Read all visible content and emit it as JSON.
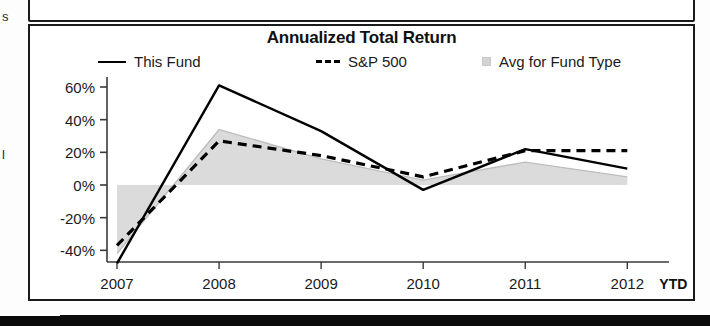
{
  "edge_fragments": {
    "top": "s",
    "middle": "l"
  },
  "chart_data": {
    "type": "line",
    "title": "Annualized Total Return",
    "xlabel": "",
    "ylabel": "",
    "categories": [
      "2007",
      "2008",
      "2009",
      "2010",
      "2011",
      "2012"
    ],
    "x_axis_suffix": "YTD",
    "ytick_labels": [
      "60%",
      "40%",
      "20%",
      "0%",
      "-20%",
      "-40%"
    ],
    "ytick_values": [
      60,
      40,
      20,
      0,
      -20,
      -40
    ],
    "ylim": [
      -50,
      68
    ],
    "grid": false,
    "legend_position": "top",
    "series": [
      {
        "name": "This Fund",
        "style": "solid",
        "color": "#000000",
        "values": [
          -48,
          61,
          33,
          -3,
          22,
          10
        ]
      },
      {
        "name": "S&P 500",
        "style": "dashed",
        "color": "#000000",
        "values": [
          -37,
          27,
          18,
          5,
          21,
          21
        ]
      },
      {
        "name": "Avg for Fund Type",
        "style": "area",
        "color": "#d9d9d9",
        "values": [
          -42,
          34,
          16,
          3,
          14,
          5
        ]
      }
    ]
  },
  "legend": {
    "fund": "This Fund",
    "sp500": "S&P 500",
    "avg": "Avg for Fund Type"
  }
}
